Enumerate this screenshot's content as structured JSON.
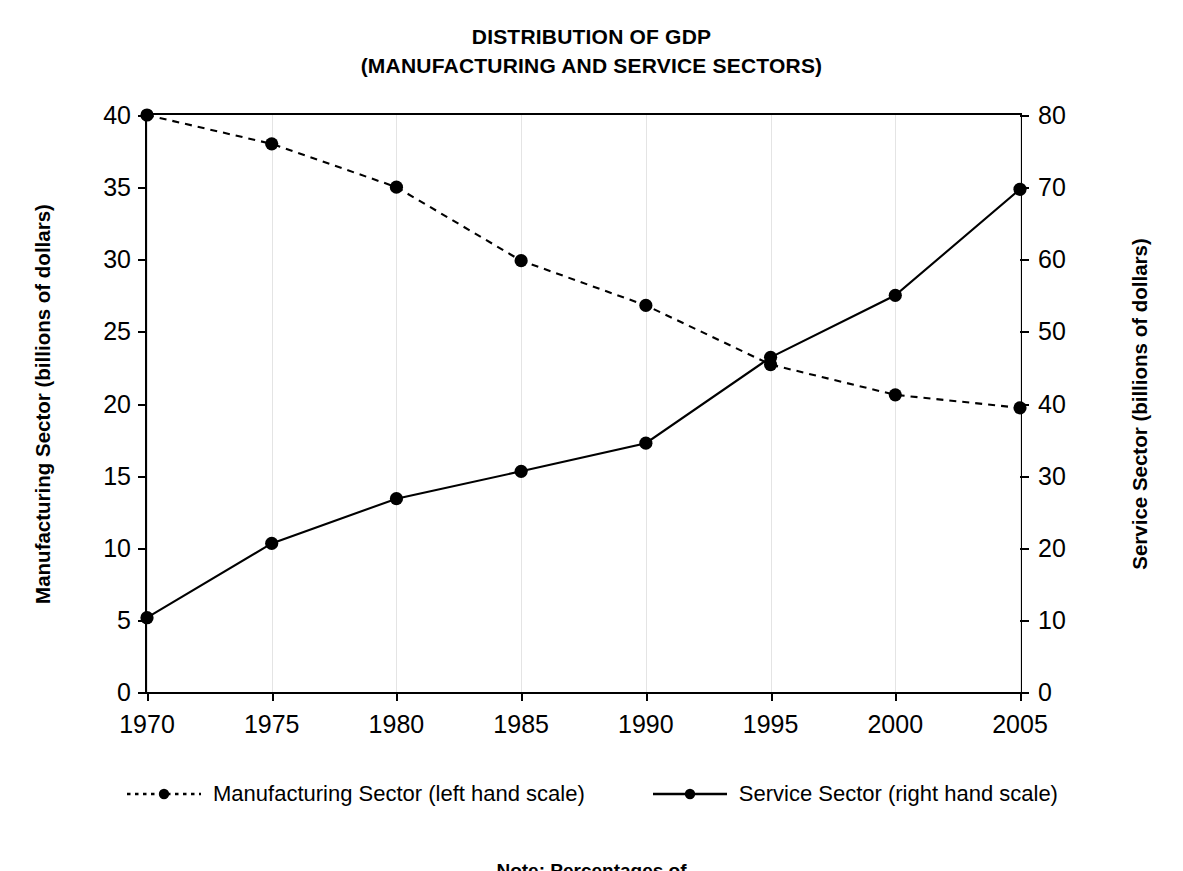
{
  "chart_data": {
    "type": "line",
    "title": "DISTRIBUTION OF GDP (MANUFACTURING AND SERVICE SECTORS)",
    "title_lines": [
      "DISTRIBUTION OF GDP",
      "(MANUFACTURING AND SERVICE SECTORS)"
    ],
    "xlabel": "",
    "ylabel": "Manufacturing Sector (billions of dollars)",
    "ylabel_right": "Service Sector (billions of dollars)",
    "x": [
      1970,
      1975,
      1980,
      1985,
      1990,
      1995,
      2000,
      2005
    ],
    "categories": [
      "1970",
      "1975",
      "1980",
      "1985",
      "1990",
      "1995",
      "2000",
      "2005"
    ],
    "xtick_labels": [
      "1970",
      "1975",
      "1980",
      "1985",
      "1990",
      "1995",
      "2000",
      "2005"
    ],
    "ytick_labels_left": [
      "0",
      "5",
      "10",
      "15",
      "20",
      "25",
      "30",
      "35",
      "40"
    ],
    "ytick_values_left": [
      0,
      5,
      10,
      15,
      20,
      25,
      30,
      35,
      40
    ],
    "ytick_labels_right": [
      "0",
      "10",
      "20",
      "30",
      "40",
      "50",
      "60",
      "70",
      "80"
    ],
    "ytick_values_right": [
      0,
      10,
      20,
      30,
      40,
      50,
      60,
      70,
      80
    ],
    "ylim": [
      0,
      40
    ],
    "ylim_right": [
      0,
      80
    ],
    "grid": "vertical-only",
    "legend_position": "below-plot",
    "series": [
      {
        "name": "Manufacturing Sector (left hand scale)",
        "axis": "left",
        "style": "dotted",
        "marker": "circle",
        "color": "#000000",
        "values": [
          40.0,
          38.0,
          35.0,
          29.9,
          26.8,
          22.7,
          20.6,
          19.7
        ]
      },
      {
        "name": "Service Sector (right hand scale)",
        "axis": "right",
        "style": "solid",
        "marker": "circle",
        "color": "#000000",
        "values": [
          10.3,
          20.6,
          26.8,
          30.6,
          34.5,
          46.4,
          55.0,
          69.7
        ]
      }
    ],
    "annotations": []
  },
  "legend": {
    "items": [
      {
        "label": "Manufacturing Sector (left hand scale)",
        "style": "dotted",
        "marker": "circle"
      },
      {
        "label": "Service Sector (right hand scale)",
        "style": "solid",
        "marker": "circle"
      }
    ]
  },
  "footnote": "Note: Percentages of"
}
